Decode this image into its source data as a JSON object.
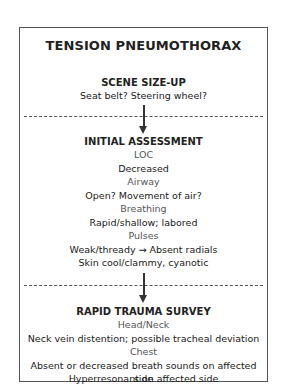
{
  "title": "TENSION PNEUMOTHORAX",
  "sections": [
    {
      "heading": "SCENE SIZE-UP",
      "lines": [
        {
          "type": "value",
          "text": "Seat belt? Steering wheel?"
        }
      ]
    },
    {
      "heading": "INITIAL ASSESSMENT",
      "lines": [
        {
          "type": "label",
          "text": "LOC"
        },
        {
          "type": "value",
          "text": "Decreased"
        },
        {
          "type": "label",
          "text": "Airway"
        },
        {
          "type": "value",
          "text": "Open? Movement of air?"
        },
        {
          "type": "label",
          "text": "Breathing"
        },
        {
          "type": "value",
          "text": "Rapid/shallow; labored"
        },
        {
          "type": "label",
          "text": "Pulses"
        },
        {
          "type": "value",
          "text": "Weak/thready → Absent radials"
        },
        {
          "type": "value",
          "text": "Skin cool/clammy, cyanotic"
        }
      ]
    },
    {
      "heading": "RAPID TRAUMA SURVEY",
      "lines": [
        {
          "type": "label",
          "text": "Head/Neck"
        },
        {
          "type": "value",
          "text": "Neck vein distention; possible tracheal deviation"
        },
        {
          "type": "label",
          "text": "Chest"
        },
        {
          "type": "value",
          "text": "Absent or decreased breath sounds on affected side"
        },
        {
          "type": "value",
          "text": "Hyperresonant on affected side"
        }
      ]
    }
  ]
}
